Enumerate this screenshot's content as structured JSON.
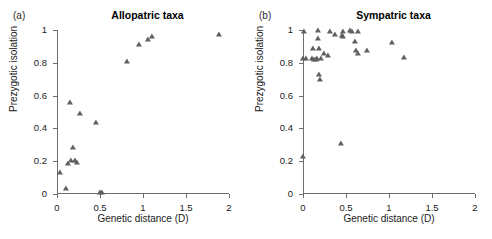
{
  "figure": {
    "background": "#ffffff",
    "marker_color": "#5f6063",
    "axis_color": "#6e6e6e"
  },
  "panels": [
    {
      "letter": "(a)",
      "title": "Allopatric taxa",
      "xlabel": "Genetic distance (D)",
      "ylabel": "Prezygotic isolation",
      "xticks": [
        "0",
        "0.5",
        "1",
        "1.5",
        "2"
      ],
      "xtick_values": [
        0,
        0.5,
        1,
        1.5,
        2
      ],
      "yticks": [
        "0",
        "0.2",
        "0.4",
        "0.6",
        "0.8",
        "1"
      ],
      "ytick_values": [
        0,
        0.2,
        0.4,
        0.6,
        0.8,
        1
      ]
    },
    {
      "letter": "(b)",
      "title": "Sympatric taxa",
      "xlabel": "Genetic distance (D)",
      "ylabel": "Prezygotic isolation",
      "xticks": [
        "0",
        "0.5",
        "1",
        "1.5",
        "2"
      ],
      "xtick_values": [
        0,
        0.5,
        1,
        1.5,
        2
      ],
      "yticks": [
        "0",
        "0.2",
        "0.4",
        "0.6",
        "0.8",
        "1"
      ],
      "ytick_values": [
        0,
        0.2,
        0.4,
        0.6,
        0.8,
        1
      ]
    }
  ],
  "chart_data": [
    {
      "type": "scatter",
      "panel": "(a)",
      "title": "Allopatric taxa",
      "xlabel": "Genetic distance (D)",
      "ylabel": "Prezygotic isolation",
      "xlim": [
        0,
        2
      ],
      "ylim": [
        0,
        1
      ],
      "grid": false,
      "legend": "none",
      "marker": "triangle",
      "points": [
        {
          "x": 0.04,
          "y": 0.13
        },
        {
          "x": 0.11,
          "y": 0.03
        },
        {
          "x": 0.13,
          "y": 0.18
        },
        {
          "x": 0.16,
          "y": 0.2
        },
        {
          "x": 0.19,
          "y": 0.28
        },
        {
          "x": 0.21,
          "y": 0.2
        },
        {
          "x": 0.23,
          "y": 0.19
        },
        {
          "x": 0.15,
          "y": 0.555
        },
        {
          "x": 0.27,
          "y": 0.485
        },
        {
          "x": 0.45,
          "y": 0.435
        },
        {
          "x": 0.5,
          "y": 0.005
        },
        {
          "x": 0.52,
          "y": 0.005
        },
        {
          "x": 0.81,
          "y": 0.805
        },
        {
          "x": 0.955,
          "y": 0.91
        },
        {
          "x": 1.055,
          "y": 0.94
        },
        {
          "x": 1.1,
          "y": 0.955
        },
        {
          "x": 1.88,
          "y": 0.97
        }
      ]
    },
    {
      "type": "scatter",
      "panel": "(b)",
      "title": "Sympatric taxa",
      "xlabel": "Genetic distance (D)",
      "ylabel": "Prezygotic isolation",
      "xlim": [
        0,
        2
      ],
      "ylim": [
        0,
        1
      ],
      "grid": false,
      "legend": "none",
      "marker": "triangle",
      "points": [
        {
          "x": 0.005,
          "y": 0.225
        },
        {
          "x": 0.005,
          "y": 0.825
        },
        {
          "x": 0.01,
          "y": 0.99
        },
        {
          "x": 0.03,
          "y": 0.825
        },
        {
          "x": 0.1,
          "y": 0.825
        },
        {
          "x": 0.12,
          "y": 0.885
        },
        {
          "x": 0.13,
          "y": 0.82
        },
        {
          "x": 0.15,
          "y": 0.82
        },
        {
          "x": 0.165,
          "y": 0.825
        },
        {
          "x": 0.175,
          "y": 0.995
        },
        {
          "x": 0.18,
          "y": 0.945
        },
        {
          "x": 0.185,
          "y": 0.885
        },
        {
          "x": 0.19,
          "y": 0.725
        },
        {
          "x": 0.2,
          "y": 0.695
        },
        {
          "x": 0.21,
          "y": 0.825
        },
        {
          "x": 0.245,
          "y": 0.855
        },
        {
          "x": 0.295,
          "y": 0.84
        },
        {
          "x": 0.315,
          "y": 0.99
        },
        {
          "x": 0.37,
          "y": 0.97
        },
        {
          "x": 0.44,
          "y": 0.305
        },
        {
          "x": 0.455,
          "y": 0.965
        },
        {
          "x": 0.46,
          "y": 0.985
        },
        {
          "x": 0.465,
          "y": 0.955
        },
        {
          "x": 0.545,
          "y": 0.995
        },
        {
          "x": 0.565,
          "y": 0.99
        },
        {
          "x": 0.6,
          "y": 0.925
        },
        {
          "x": 0.615,
          "y": 0.875
        },
        {
          "x": 0.635,
          "y": 0.99
        },
        {
          "x": 0.645,
          "y": 0.855
        },
        {
          "x": 0.74,
          "y": 0.875
        },
        {
          "x": 1.04,
          "y": 0.92
        },
        {
          "x": 1.17,
          "y": 0.83
        }
      ]
    }
  ]
}
